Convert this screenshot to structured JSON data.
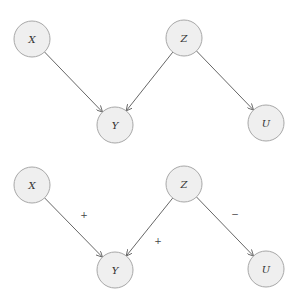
{
  "diagram": {
    "style": {
      "node_fill": "#efefef",
      "node_stroke": "#a8a8a8",
      "edge_color": "#555555",
      "node_radius": 18
    },
    "graphs": [
      {
        "name": "unsigned-dag",
        "nodes": [
          {
            "id": "X",
            "label": "X",
            "cx": 32,
            "cy": 39
          },
          {
            "id": "Y",
            "label": "Y",
            "cx": 115,
            "cy": 125
          },
          {
            "id": "Z",
            "label": "Z",
            "cx": 184,
            "cy": 38
          },
          {
            "id": "U",
            "label": "U",
            "cx": 266,
            "cy": 123
          }
        ],
        "edges": [
          {
            "from": "X",
            "to": "Y",
            "sign": ""
          },
          {
            "from": "Z",
            "to": "Y",
            "sign": ""
          },
          {
            "from": "Z",
            "to": "U",
            "sign": ""
          }
        ]
      },
      {
        "name": "signed-dag",
        "nodes": [
          {
            "id": "X",
            "label": "X",
            "cx": 32,
            "cy": 185
          },
          {
            "id": "Y",
            "label": "Y",
            "cx": 115,
            "cy": 270
          },
          {
            "id": "Z",
            "label": "Z",
            "cx": 184,
            "cy": 184
          },
          {
            "id": "U",
            "label": "U",
            "cx": 266,
            "cy": 269
          }
        ],
        "edges": [
          {
            "from": "X",
            "to": "Y",
            "sign": "+",
            "lx": 84,
            "ly": 215
          },
          {
            "from": "Z",
            "to": "Y",
            "sign": "+",
            "lx": 158,
            "ly": 241
          },
          {
            "from": "Z",
            "to": "U",
            "sign": "−",
            "lx": 235,
            "ly": 214
          }
        ]
      }
    ]
  }
}
